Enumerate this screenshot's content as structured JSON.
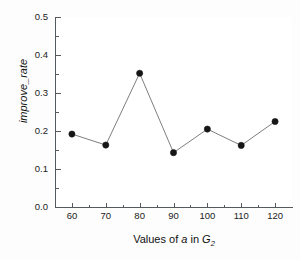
{
  "chart_data": {
    "type": "line",
    "title": "",
    "subtitle": "",
    "xlabel": "Values of a in G2",
    "xlabel_parts": {
      "prefix": "Values of ",
      "italic_var": "a",
      "middle": " in ",
      "italic_group": "G",
      "subscript": "2"
    },
    "ylabel": "improve_rate",
    "x": [
      60,
      70,
      80,
      90,
      100,
      110,
      120
    ],
    "values": [
      0.192,
      0.163,
      0.352,
      0.143,
      0.205,
      0.162,
      0.225
    ],
    "series": [
      {
        "name": "improve_rate",
        "values": [
          0.192,
          0.163,
          0.352,
          0.143,
          0.205,
          0.162,
          0.225
        ]
      }
    ],
    "xlim": [
      55,
      125
    ],
    "ylim": [
      0.0,
      0.5
    ],
    "xticks": [
      60,
      70,
      80,
      90,
      100,
      110,
      120
    ],
    "xtick_labels": [
      "60",
      "70",
      "80",
      "90",
      "100",
      "110",
      "120"
    ],
    "yticks": [
      0.0,
      0.1,
      0.2,
      0.3,
      0.4,
      0.5
    ],
    "ytick_labels": [
      "0.0",
      "0.1",
      "0.2",
      "0.3",
      "0.4",
      "0.5"
    ],
    "y_minor_ticks": [
      0.05,
      0.15,
      0.25,
      0.35,
      0.45
    ],
    "x_minor_ticks": [
      65,
      75,
      85,
      95,
      105,
      115
    ],
    "grid": false,
    "legend": false,
    "legend_position": "none",
    "marker": "filled-circle",
    "marker_color": "#161616",
    "line_color": "#6d6f72",
    "background_color": "#ffffff",
    "axis_color": "#555a5e",
    "text_color": "#1b1b1b"
  }
}
